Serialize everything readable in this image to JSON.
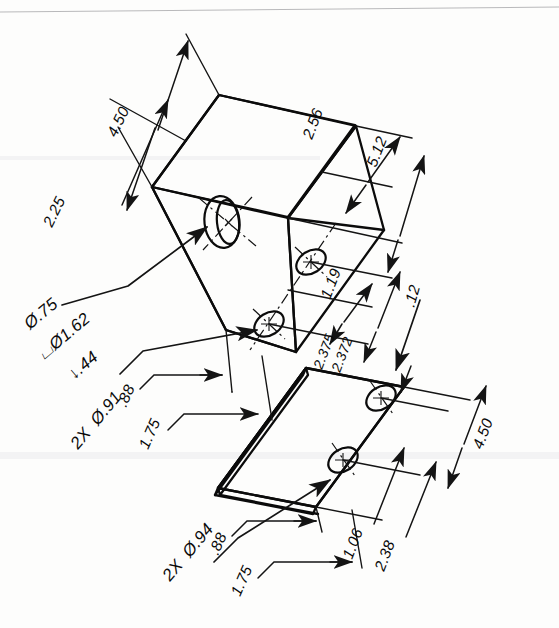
{
  "drawing": {
    "title": "Isometric mechanical part drawing",
    "type": "isometric technical drawing",
    "units": "inches",
    "line_color": "#0b0b0b",
    "paper_color": "#fdfdfc"
  },
  "parts": [
    {
      "id": "main-block",
      "name": "Main rectangular block",
      "features": [
        "counterbored hole on front-left face",
        "two through holes on top-right face"
      ]
    },
    {
      "id": "lower-plate",
      "name": "Thin mounting plate",
      "features": [
        "two countersunk holes"
      ]
    }
  ],
  "callouts": {
    "counterbore": {
      "name": "counterbore-callout",
      "line1": "Ø.75",
      "line2_symbol": "⌴",
      "line2": "Ø1.62",
      "line3_symbol": "↓",
      "line3": ".44",
      "full": "Ø.75 / ⌴Ø1.62 / ↓.44"
    },
    "block_holes": {
      "name": "block-holes-callout",
      "text": "2X  Ø.91"
    },
    "plate_holes": {
      "name": "plate-holes-callout",
      "text": "2X  Ø.94"
    }
  },
  "dimensions": {
    "block": [
      {
        "id": "dim-4-50-top",
        "value": "4.50",
        "name": "block-length-dimension"
      },
      {
        "id": "dim-2-25",
        "value": "2.25",
        "name": "block-half-length-dimension"
      },
      {
        "id": "dim-2-56",
        "value": "2.56",
        "name": "block-half-width-dimension"
      },
      {
        "id": "dim-5-12",
        "value": "5.12",
        "name": "block-width-dimension"
      },
      {
        "id": "dim-1-19",
        "value": "1.19",
        "name": "hole-edge-offset-dimension"
      },
      {
        "id": "dim-2-375",
        "value": "2.375",
        "name": "hole-spacing-upper-limit"
      },
      {
        "id": "dim-2-372",
        "value": "2.372",
        "name": "hole-spacing-lower-limit"
      },
      {
        "id": "dim-88-block",
        "value": ".88",
        "name": "block-hole-offset-dimension"
      },
      {
        "id": "dim-175-block",
        "value": "1.75",
        "name": "block-hole-position-dimension"
      }
    ],
    "plate": [
      {
        "id": "dim-12",
        "value": ".12",
        "name": "plate-thickness-dimension"
      },
      {
        "id": "dim-4-50-plate",
        "value": "4.50",
        "name": "plate-length-dimension"
      },
      {
        "id": "dim-1-06",
        "value": "1.06",
        "name": "plate-hole-offset-dimension"
      },
      {
        "id": "dim-2-38",
        "value": "2.38",
        "name": "plate-hole-spacing-dimension"
      },
      {
        "id": "dim-88-plate",
        "value": ".88",
        "name": "plate-edge-offset-dimension"
      },
      {
        "id": "dim-175-plate",
        "value": "1.75",
        "name": "plate-hole-position-dimension"
      }
    ]
  }
}
